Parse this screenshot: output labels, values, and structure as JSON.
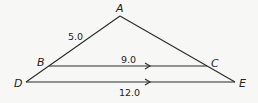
{
  "diagram": {
    "type": "similar triangles with parallel lines",
    "points": {
      "A": {
        "label": "A"
      },
      "B": {
        "label": "B"
      },
      "C": {
        "label": "C"
      },
      "D": {
        "label": "D"
      },
      "E": {
        "label": "E"
      }
    },
    "measurements": {
      "AB": "5.0",
      "BC": "9.0",
      "DE": "12.0"
    },
    "parallel_marks": [
      "BC",
      "DE"
    ]
  }
}
